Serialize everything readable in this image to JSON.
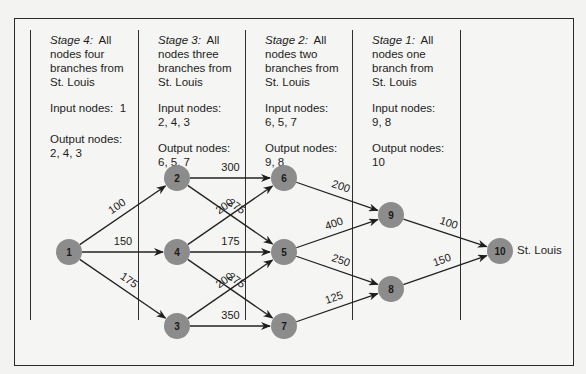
{
  "stages": [
    {
      "stage_label": "Stage 4:",
      "stage_rest": "All",
      "desc": [
        "nodes four",
        "branches from",
        "St. Louis"
      ],
      "input_label": "Input nodes:",
      "input_values": "1",
      "output_label": "Output nodes:",
      "output_values": "2, 4, 3"
    },
    {
      "stage_label": "Stage 3:",
      "stage_rest": "All",
      "desc": [
        "nodes three",
        "branches from",
        "St. Louis"
      ],
      "input_label": "Input nodes:",
      "input_values": "2, 4, 3",
      "output_label": "Output nodes:",
      "output_values": "6, 5, 7"
    },
    {
      "stage_label": "Stage 2:",
      "stage_rest": "All",
      "desc": [
        "nodes two",
        "branches from",
        "St. Louis"
      ],
      "input_label": "Input nodes:",
      "input_values": "6, 5, 7",
      "output_label": "Output nodes:",
      "output_values": "9, 8"
    },
    {
      "stage_label": "Stage 1:",
      "stage_rest": "All",
      "desc": [
        "nodes one",
        "branch from",
        "St. Louis"
      ],
      "input_label": "Input nodes:",
      "input_values": "9, 8",
      "output_label": "Output nodes:",
      "output_values": "10"
    }
  ],
  "nodes": [
    {
      "id": "1",
      "x": 69,
      "y": 252
    },
    {
      "id": "2",
      "x": 177,
      "y": 178
    },
    {
      "id": "4",
      "x": 177,
      "y": 252
    },
    {
      "id": "3",
      "x": 177,
      "y": 326
    },
    {
      "id": "6",
      "x": 284,
      "y": 178
    },
    {
      "id": "5",
      "x": 284,
      "y": 252
    },
    {
      "id": "7",
      "x": 284,
      "y": 326
    },
    {
      "id": "9",
      "x": 391,
      "y": 215
    },
    {
      "id": "8",
      "x": 391,
      "y": 289
    },
    {
      "id": "10",
      "x": 500,
      "y": 251
    }
  ],
  "edges": [
    {
      "from": "1",
      "to": "2",
      "weight": "100"
    },
    {
      "from": "1",
      "to": "4",
      "weight": "150"
    },
    {
      "from": "1",
      "to": "3",
      "weight": "175"
    },
    {
      "from": "2",
      "to": "6",
      "weight": "300"
    },
    {
      "from": "2",
      "to": "5",
      "weight": "275"
    },
    {
      "from": "4",
      "to": "6",
      "weight": "200"
    },
    {
      "from": "4",
      "to": "5",
      "weight": "175"
    },
    {
      "from": "4",
      "to": "7",
      "weight": "275"
    },
    {
      "from": "3",
      "to": "5",
      "weight": "200"
    },
    {
      "from": "3",
      "to": "7",
      "weight": "350"
    },
    {
      "from": "6",
      "to": "9",
      "weight": "200"
    },
    {
      "from": "5",
      "to": "9",
      "weight": "400"
    },
    {
      "from": "5",
      "to": "8",
      "weight": "250"
    },
    {
      "from": "7",
      "to": "8",
      "weight": "125"
    },
    {
      "from": "9",
      "to": "10",
      "weight": "100"
    },
    {
      "from": "8",
      "to": "10",
      "weight": "150"
    }
  ],
  "destination_label": "St. Louis",
  "colors": {
    "node_fill": "#8c8c8c",
    "line": "#222222",
    "background": "#f5f5f3"
  }
}
